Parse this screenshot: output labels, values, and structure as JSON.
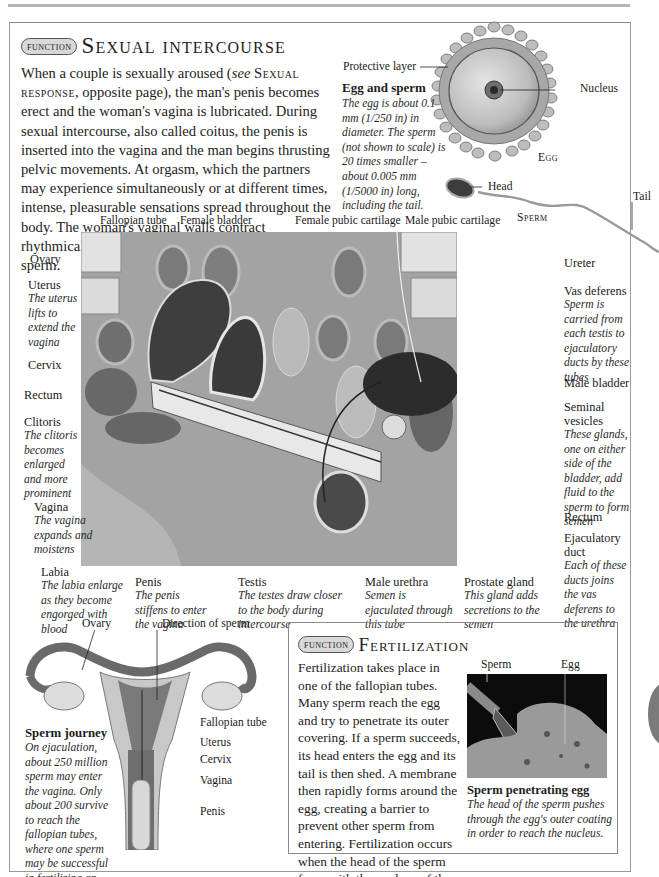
{
  "page": {
    "section_badge": "FUNCTION",
    "title": "Sexual intercourse",
    "intro": {
      "before_ref": "When a couple is sexually aroused (",
      "see": "see",
      "ref": "Sexual response",
      "after_ref": ", opposite page), the man's penis becomes erect and the woman's vagina is lubricated. During sexual intercourse, also called coitus, the penis is inserted into the vagina and the man begins thrusting pelvic movements. At orgasm, which the partners may experience simultaneously or at different times, intense, pleasurable sensations spread throughout the body. The woman's vaginal walls contract rhythmically and the man ejaculates, releasing sperm."
    }
  },
  "egg_sperm": {
    "protective_layer_label": "Protective layer",
    "nucleus_label": "Nucleus",
    "egg_label": "Egg",
    "head_label": "Head",
    "tail_label": "Tail",
    "sperm_label": "Sperm",
    "caption_title": "Egg and sperm",
    "caption_desc": "The egg is about 0.1 mm (1/250 in) in diameter. The sperm (not shown to scale) is 20 times smaller – about 0.005 mm (1/5000 in) long, including the tail."
  },
  "cross_section": {
    "top_labels": [
      {
        "id": "fallopian-tube",
        "text": "Fallopian tube"
      },
      {
        "id": "female-bladder",
        "text": "Female bladder"
      },
      {
        "id": "female-pubic-cartilage",
        "text": "Female pubic cartilage"
      },
      {
        "id": "male-pubic-cartilage",
        "text": "Male pubic cartilage"
      }
    ],
    "left_labels": [
      {
        "id": "ovary",
        "title": "Ovary",
        "desc": ""
      },
      {
        "id": "uterus",
        "title": "Uterus",
        "desc": "The uterus lifts to extend the vagina"
      },
      {
        "id": "cervix",
        "title": "Cervix",
        "desc": ""
      },
      {
        "id": "rectum-f",
        "title": "Rectum",
        "desc": ""
      },
      {
        "id": "clitoris",
        "title": "Clitoris",
        "desc": "The clitoris becomes enlarged and more prominent"
      },
      {
        "id": "vagina",
        "title": "Vagina",
        "desc": "The vagina expands and moistens"
      }
    ],
    "right_labels": [
      {
        "id": "ureter",
        "title": "Ureter",
        "desc": ""
      },
      {
        "id": "vas-deferens",
        "title": "Vas deferens",
        "desc": "Sperm is carried from each testis to ejaculatory ducts by these tubes"
      },
      {
        "id": "male-bladder",
        "title": "Male bladder",
        "desc": ""
      },
      {
        "id": "seminal-vesicles",
        "title": "Seminal vesicles",
        "desc": "These glands, one on either side of the bladder, add fluid to the sperm to form semen"
      },
      {
        "id": "rectum-m",
        "title": "Rectum",
        "desc": ""
      },
      {
        "id": "ejaculatory-duct",
        "title": "Ejaculatory duct",
        "desc": "Each of these ducts joins the vas deferens to the urethra"
      }
    ],
    "bottom_labels": [
      {
        "id": "labia",
        "title": "Labia",
        "desc": "The labia enlarge as they become engorged with blood"
      },
      {
        "id": "penis",
        "title": "Penis",
        "desc": "The penis stiffens to enter the vagina"
      },
      {
        "id": "testis",
        "title": "Testis",
        "desc": "The testes draw closer to the body during intercourse"
      },
      {
        "id": "male-urethra",
        "title": "Male urethra",
        "desc": "Semen is ejaculated through this tube"
      },
      {
        "id": "prostate-gland",
        "title": "Prostate gland",
        "desc": "This gland adds secretions to the semen"
      }
    ]
  },
  "sperm_journey": {
    "labels": {
      "ovary": "Ovary",
      "direction": "Direction of sperm",
      "fallopian_tube": "Fallopian tube",
      "uterus": "Uterus",
      "cervix": "Cervix",
      "vagina": "Vagina",
      "penis": "Penis"
    },
    "caption_title": "Sperm journey",
    "caption_desc": "On ejaculation, about 250 million sperm may enter the vagina. Only about 200 survive to reach the fallopian tubes, where one sperm may be successful in fertilizing an egg."
  },
  "fertilization": {
    "section_badge": "FUNCTION",
    "title": "Fertilization",
    "body": "Fertilization takes place in one of the fallopian tubes. Many sperm reach the egg and try to penetrate its outer covering. If a sperm succeeds, its head enters the egg and its tail is then shed. A membrane then rapidly forms around the egg, creating a barrier to prevent other sperm from entering. Fertilization occurs when the head of the sperm fuses with the nucleus of the egg.",
    "micro_labels": {
      "sperm": "Sperm",
      "egg": "Egg"
    },
    "caption_title": "Sperm penetrating egg",
    "caption_desc": "The head of the sperm pushes through the egg's outer coating in order to reach the nucleus."
  }
}
